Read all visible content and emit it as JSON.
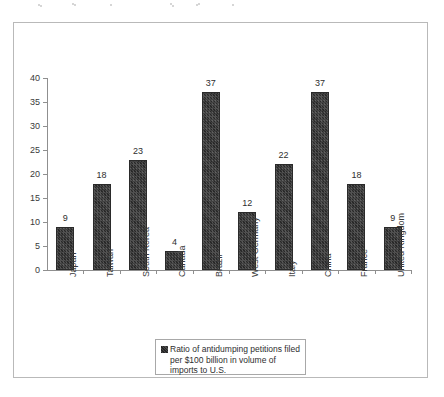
{
  "figure": {
    "background_color": "#ffffff",
    "frame_color": "#b9b9b9",
    "bar_color": "#3a3a3a",
    "axis_color": "#8f8f8f",
    "text_color": "#2e2e2e"
  },
  "legend": {
    "swatch_icon": "legend-color-swatch",
    "text": "Ratio of antidumping petitions filed per $100 billion in volume of imports to U.S."
  },
  "chart_data": {
    "type": "bar",
    "title": "",
    "xlabel": "",
    "ylabel": "",
    "ylim": [
      0,
      40
    ],
    "yticks": [
      0,
      5,
      10,
      15,
      20,
      25,
      30,
      35,
      40
    ],
    "ytick_labels": [
      "0",
      "5",
      "10",
      "15",
      "20",
      "25",
      "30",
      "35",
      "40"
    ],
    "grid": false,
    "legend_position": "bottom-center",
    "legend_entries": [
      "Ratio of antidumping petitions filed per $100 billion in volume of imports to U.S."
    ],
    "data_labels_shown": true,
    "categories": [
      "Japan",
      "Taiwan",
      "South Korea",
      "Canada",
      "Brazil",
      "West Germany",
      "Italy",
      "China",
      "France",
      "United Kingdom"
    ],
    "values": [
      9,
      18,
      23,
      4,
      37,
      12,
      22,
      37,
      18,
      9
    ],
    "series": [
      {
        "name": "Ratio of antidumping petitions filed per $100 billion in volume of imports to U.S.",
        "values": [
          9,
          18,
          23,
          4,
          37,
          12,
          22,
          37,
          18,
          9
        ]
      }
    ]
  }
}
